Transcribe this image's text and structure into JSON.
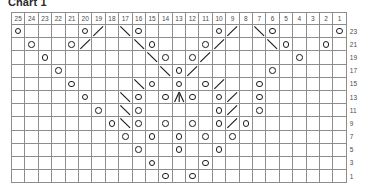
{
  "title": "Chart 1",
  "colors": {
    "no_stitch": "#8d8d8d",
    "grid_line": "#8d8d8d",
    "symbol": "#1c1c1c",
    "background": "#ffffff",
    "label": "#4a4a4a"
  },
  "legend_symbols": {
    "yo": "yarn-over-circle",
    "k2tog": "right-leaning-decrease",
    "ssk": "left-leaning-decrease",
    "cdd": "central-double-decrease",
    "nostitch": "no-stitch-shaded"
  },
  "chart_data": {
    "type": "table",
    "title": "Chart 1",
    "columns": 25,
    "rows": 12,
    "column_labels": [
      "25",
      "24",
      "23",
      "22",
      "21",
      "20",
      "19",
      "18",
      "17",
      "16",
      "15",
      "14",
      "13",
      "12",
      "11",
      "10",
      "9",
      "8",
      "7",
      "6",
      "5",
      "4",
      "3",
      "2",
      "1"
    ],
    "row_labels": [
      "23",
      "21",
      "19",
      "17",
      "15",
      "13",
      "11",
      "9",
      "7",
      "5",
      "3",
      "1"
    ],
    "symbol_key": {
      "o": "yarn over",
      "/": "right-leaning decrease",
      "\\": "left-leaning decrease",
      "A": "central double decrease",
      "x": "no stitch",
      ".": "knit / empty"
    },
    "cells": [
      [
        "o",
        ".",
        ".",
        ".",
        ".",
        "o",
        "/",
        ".",
        "\\",
        "o",
        ".",
        ".",
        ".",
        ".",
        ".",
        "o",
        "/",
        ".",
        "\\",
        "o",
        ".",
        ".",
        ".",
        ".",
        "o"
      ],
      [
        "x",
        "o",
        ".",
        ".",
        "o",
        "/",
        ".",
        ".",
        ".",
        "\\",
        "o",
        ".",
        ".",
        ".",
        "o",
        "/",
        ".",
        ".",
        ".",
        "\\",
        "o",
        ".",
        ".",
        "o",
        "x"
      ],
      [
        "x",
        "x",
        "o",
        ".",
        ".",
        ".",
        ".",
        ".",
        ".",
        ".",
        "\\",
        "o",
        ".",
        "o",
        "/",
        ".",
        ".",
        ".",
        ".",
        ".",
        ".",
        "o",
        "x",
        "x",
        "."
      ],
      [
        "x",
        "x",
        "x",
        "o",
        ".",
        ".",
        ".",
        ".",
        ".",
        ".",
        ".",
        "\\",
        "o",
        "/",
        ".",
        ".",
        ".",
        ".",
        ".",
        "o",
        "x",
        "x",
        "x",
        ".",
        "."
      ],
      [
        "x",
        "x",
        "x",
        "x",
        "o",
        ".",
        ".",
        ".",
        ".",
        "\\",
        "o",
        ".",
        "o",
        ".",
        "o",
        "/",
        ".",
        ".",
        "o",
        "x",
        "x",
        "x",
        "x",
        ".",
        "."
      ],
      [
        "x",
        "x",
        "x",
        "x",
        "x",
        "o",
        ".",
        ".",
        "\\",
        "o",
        ".",
        "o",
        "A",
        "o",
        ".",
        "o",
        "/",
        ".",
        "o",
        "x",
        "x",
        "x",
        "x",
        "x",
        "."
      ],
      [
        "x",
        "x",
        "x",
        "x",
        "x",
        "x",
        "o",
        ".",
        "\\",
        "o",
        ".",
        ".",
        ".",
        ".",
        ".",
        "o",
        "/",
        ".",
        "o",
        "x",
        "x",
        "x",
        "x",
        "x",
        "x"
      ],
      [
        "x",
        "x",
        "x",
        "x",
        "x",
        "x",
        "x",
        "o",
        "\\",
        "o",
        ".",
        "o",
        ".",
        "o",
        ".",
        "o",
        "/",
        "o",
        "x",
        "x",
        "x",
        "x",
        "x",
        "x",
        "x"
      ],
      [
        "x",
        "x",
        "x",
        "x",
        "x",
        "x",
        "x",
        "x",
        "o",
        ".",
        "o",
        ".",
        "o",
        ".",
        "o",
        ".",
        "o",
        "x",
        "x",
        "x",
        "x",
        "x",
        "x",
        "x",
        "x"
      ],
      [
        "x",
        "x",
        "x",
        "x",
        "x",
        "x",
        "x",
        "x",
        "x",
        "o",
        ".",
        ".",
        "o",
        ".",
        ".",
        "o",
        "x",
        "x",
        "x",
        "x",
        "x",
        "x",
        "x",
        "x",
        "x"
      ],
      [
        "x",
        "x",
        "x",
        "x",
        "x",
        "x",
        "x",
        "x",
        "x",
        "x",
        "o",
        ".",
        ".",
        ".",
        "o",
        "x",
        "x",
        "x",
        "x",
        "x",
        "x",
        "x",
        "x",
        "x",
        "x"
      ],
      [
        "x",
        "x",
        "x",
        "x",
        "x",
        "x",
        "x",
        "x",
        "x",
        "x",
        "x",
        "o",
        ".",
        "o",
        "x",
        "x",
        "x",
        "x",
        "x",
        "x",
        "x",
        "x",
        "x",
        "x",
        "x"
      ]
    ]
  }
}
